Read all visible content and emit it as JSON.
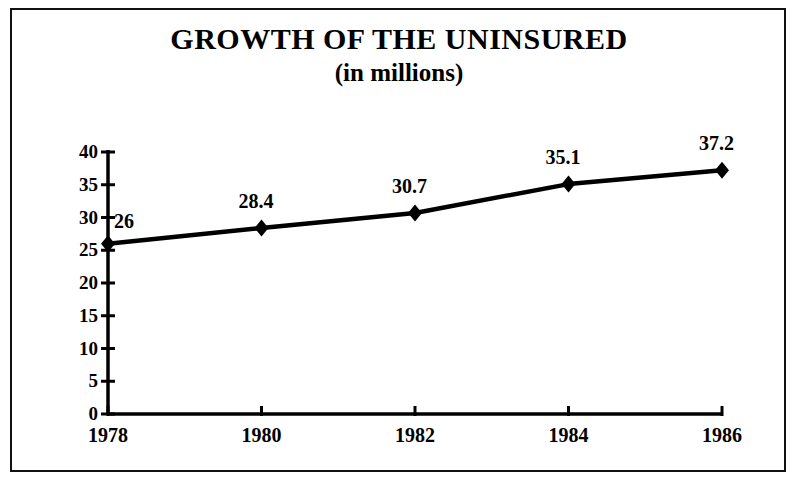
{
  "chart_data": {
    "type": "line",
    "title": "GROWTH OF THE UNINSURED",
    "subtitle": "(in millions)",
    "xlabel": "",
    "ylabel": "",
    "categories": [
      "1978",
      "1980",
      "1982",
      "1984",
      "1986"
    ],
    "x": [
      1978,
      1980,
      1982,
      1984,
      1986
    ],
    "values": [
      26,
      28.4,
      30.7,
      35.1,
      37.2
    ],
    "point_labels": [
      "26",
      "28.4",
      "30.7",
      "35.1",
      "37.2"
    ],
    "series": [
      {
        "name": "Uninsured (millions)",
        "values": [
          26,
          28.4,
          30.7,
          35.1,
          37.2
        ]
      }
    ],
    "ylim": [
      0,
      40
    ],
    "xlim": [
      1978,
      1986
    ],
    "yticks": [
      0,
      5,
      10,
      15,
      20,
      25,
      30,
      35,
      40
    ],
    "ytick_labels": [
      "0",
      "5",
      "10",
      "15",
      "20",
      "25",
      "30",
      "35",
      "40"
    ],
    "xticks": [
      1978,
      1980,
      1982,
      1984,
      1986
    ],
    "xtick_labels": [
      "1978",
      "1980",
      "1982",
      "1984",
      "1986"
    ],
    "grid": false,
    "legend": false,
    "legend_position": "none",
    "marker": "diamond",
    "line_color": "#000000",
    "marker_color": "#000000",
    "axis_color": "#000000",
    "background_color": "#ffffff",
    "border_color": "#111111"
  },
  "figure": {
    "frame_visible": true
  }
}
